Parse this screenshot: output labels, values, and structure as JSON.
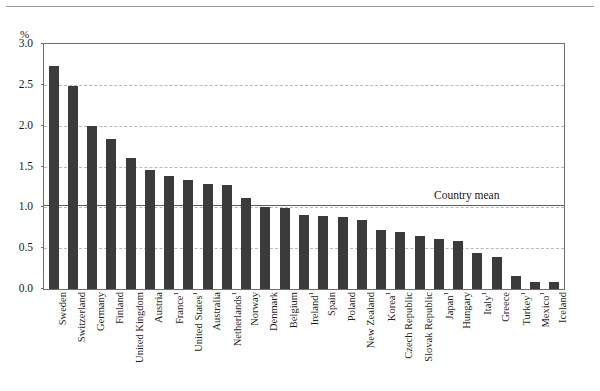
{
  "chart_data": {
    "type": "bar",
    "title": "",
    "xlabel": "",
    "ylabel": "%",
    "ylim": [
      0.0,
      3.0
    ],
    "yticks": [
      "0.0",
      "0.5",
      "1.0",
      "1.5",
      "2.0",
      "2.5",
      "3.0"
    ],
    "ytick_values": [
      0.0,
      0.5,
      1.0,
      1.5,
      2.0,
      2.5,
      3.0
    ],
    "grid": true,
    "legend": "none",
    "annotations": [
      {
        "name": "country-mean",
        "label": "Country mean",
        "value": 1.03
      }
    ],
    "categories": [
      "Sweden",
      "Switzerland",
      "Germany",
      "Finland",
      "United Kingdom",
      "Austria",
      "France",
      "United States",
      "Australia",
      "Netherlands",
      "Norway",
      "Denmark",
      "Belgium",
      "Ireland",
      "Spain",
      "Poland",
      "New Zealand",
      "Korea",
      "Czech Republic",
      "Slovak Republic",
      "Japan",
      "Hungary",
      "Italy",
      "Greece",
      "Turkey",
      "Mexico",
      "Iceland"
    ],
    "category_labels": [
      "Sweden",
      "Switzerland",
      "Germany",
      "Finland",
      "United Kingdom",
      "Austria",
      "France¹",
      "United States¹",
      "Australia",
      "Netherlands¹",
      "Norway",
      "Denmark",
      "Belgium",
      "Ireland¹",
      "Spain",
      "Poland",
      "New Zealand",
      "Korea¹",
      "Czech Republic",
      "Slovak Republic",
      "Japan¹",
      "Hungary",
      "Italy¹",
      "Greece",
      "Turkey¹",
      "Mexico¹",
      "Iceland"
    ],
    "footnote_markers": [
      "",
      "",
      "",
      "",
      "",
      "",
      "1",
      "1",
      "",
      "1",
      "",
      "",
      "",
      "1",
      "",
      "",
      "",
      "1",
      "",
      "",
      "1",
      "",
      "1",
      "",
      "1",
      "1",
      ""
    ],
    "values": [
      2.73,
      2.49,
      2.0,
      1.84,
      1.6,
      1.46,
      1.38,
      1.33,
      1.29,
      1.27,
      1.12,
      1.0,
      0.99,
      0.91,
      0.89,
      0.88,
      0.85,
      0.72,
      0.7,
      0.65,
      0.61,
      0.59,
      0.44,
      0.39,
      0.16,
      0.08,
      0.08
    ],
    "bar_color": "#3b3b3b",
    "gridline_color": "#b9b9b9",
    "mean_line_color": "#5d5d5d",
    "frame_color": "#6f6f6f"
  }
}
